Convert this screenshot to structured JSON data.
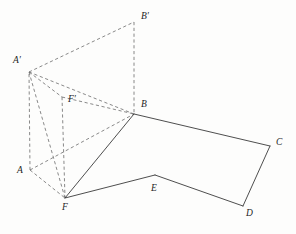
{
  "figure": {
    "type": "geometry-diagram",
    "canvas": {
      "width": 296,
      "height": 234
    },
    "colors": {
      "background": "#fdfdfc",
      "solid_edge": "#3a3a3a",
      "dashed_edge": "#6b6b6b",
      "label_text": "#1e1e1e"
    },
    "vertices": [
      {
        "id": "A",
        "label": "A",
        "x": 30,
        "y": 170,
        "label_x": 17,
        "label_y": 166
      },
      {
        "id": "B",
        "label": "B",
        "x": 134,
        "y": 114,
        "label_x": 141,
        "label_y": 100
      },
      {
        "id": "C",
        "label": "C",
        "x": 270,
        "y": 146,
        "label_x": 276,
        "label_y": 138
      },
      {
        "id": "D",
        "label": "D",
        "x": 243,
        "y": 206,
        "label_x": 246,
        "label_y": 209
      },
      {
        "id": "E",
        "label": "E",
        "x": 155,
        "y": 175,
        "label_x": 151,
        "label_y": 184
      },
      {
        "id": "F",
        "label": "F",
        "x": 65,
        "y": 198,
        "label_x": 62,
        "label_y": 203
      },
      {
        "id": "Aprime",
        "label": "A′",
        "x": 29,
        "y": 72,
        "label_x": 13,
        "label_y": 56
      },
      {
        "id": "Bprime",
        "label": "B′",
        "x": 134,
        "y": 22,
        "label_x": 141,
        "label_y": 12
      },
      {
        "id": "Fprime",
        "label": "F′",
        "x": 62,
        "y": 97,
        "label_x": 68,
        "label_y": 95
      }
    ],
    "solid_edges": [
      {
        "name": "edge-F-B",
        "from": "F",
        "to": "B",
        "d": "M 65 198 L 134 114"
      },
      {
        "name": "edge-B-C",
        "from": "B",
        "to": "C",
        "d": "M 134 114 L 270 146"
      },
      {
        "name": "edge-C-D",
        "from": "C",
        "to": "D",
        "d": "M 270 146 L 243 206"
      },
      {
        "name": "edge-D-E",
        "from": "D",
        "to": "E",
        "d": "M 243 206 L 155 175"
      },
      {
        "name": "edge-E-F",
        "from": "E",
        "to": "F",
        "d": "M 155 175 L 65 198"
      }
    ],
    "dashed_edges": [
      {
        "name": "edge-A-F",
        "from": "A",
        "to": "F",
        "d": "M 30 170 L 65 198"
      },
      {
        "name": "edge-A-B",
        "from": "A",
        "to": "B",
        "d": "M 30 170 L 134 114"
      },
      {
        "name": "edge-A-Aprime",
        "from": "A",
        "to": "Aprime",
        "d": "M 30 170 L 29 72"
      },
      {
        "name": "edge-Aprime-Bprime",
        "from": "Aprime",
        "to": "Bprime",
        "d": "M 29 72 L 134 22"
      },
      {
        "name": "edge-Bprime-B",
        "from": "Bprime",
        "to": "B",
        "d": "M 134 22 L 134 114"
      },
      {
        "name": "edge-Aprime-B",
        "from": "Aprime",
        "to": "B",
        "d": "M 29 72 L 134 114"
      },
      {
        "name": "edge-Aprime-Fprime",
        "from": "Aprime",
        "to": "Fprime",
        "d": "M 29 72 L 62 97"
      },
      {
        "name": "edge-Fprime-B",
        "from": "Fprime",
        "to": "B",
        "d": "M 62 97 L 134 114"
      },
      {
        "name": "edge-Fprime-F",
        "from": "Fprime",
        "to": "F",
        "d": "M 62 97 L 65 198"
      },
      {
        "name": "edge-Aprime-F",
        "from": "Aprime",
        "to": "F",
        "d": "M 29 72 L 65 198"
      }
    ]
  }
}
